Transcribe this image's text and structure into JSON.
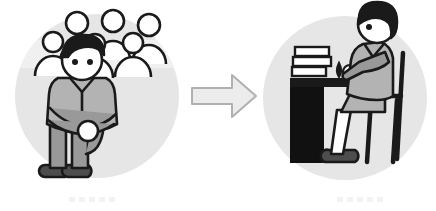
{
  "figure": {
    "type": "before-after-illustration",
    "direction": "left-to-right",
    "background_color": "#ffffff"
  },
  "colors": {
    "circle_background": "#e6e6e6",
    "crowd_band": "#f0f0f0",
    "outline": "#1a1a1a",
    "skin": "#ffffff",
    "hair": "#1a1a1a",
    "shirt": "#b3b3b3",
    "pants": "#999999",
    "shoes": "#4d4d4d",
    "desk_panel": "#111111",
    "desk_top": "#1a1a1a",
    "book_fill": "#ffffff",
    "arrow_fill": "#ececec",
    "arrow_stroke": "#b0b0b0",
    "caption_dot": "#f2f2f2"
  },
  "scene_before": {
    "label": "anxious-person-in-crowd",
    "circle": {
      "cx": 97,
      "cy": 96,
      "r": 82
    },
    "crowd": {
      "label": "crowd-of-people",
      "count": 6,
      "back_row": [
        {
          "cx": 77,
          "cy": 23,
          "r": 11
        },
        {
          "cx": 113,
          "cy": 21,
          "r": 11
        },
        {
          "cx": 149,
          "cy": 25,
          "r": 11
        }
      ],
      "front_row": [
        {
          "cx": 53,
          "cy": 42,
          "r": 10
        },
        {
          "cx": 95,
          "cy": 44,
          "r": 10
        },
        {
          "cx": 133,
          "cy": 43,
          "r": 10
        }
      ]
    },
    "seated_person": {
      "label": "seated-hugging-knees-person",
      "pose": "knees-hugged",
      "hair": "dark-short",
      "eyes": 2
    }
  },
  "arrow": {
    "label": "transition-arrow",
    "points": "right",
    "text": ""
  },
  "scene_after": {
    "label": "person-working-at-desk",
    "circle": {
      "cx": 345,
      "cy": 98,
      "r": 82
    },
    "desk": {
      "label": "desk",
      "has_dark_side_panel": true
    },
    "books": {
      "label": "stack-of-books",
      "count": 3
    },
    "desk_items": [
      {
        "label": "mug"
      },
      {
        "label": "small-object"
      }
    ],
    "chair": {
      "label": "chair",
      "back": "tall"
    },
    "person": {
      "label": "working-person",
      "pose": "seated-at-desk-profile",
      "hair": "dark-short",
      "eyes": 1
    }
  },
  "captions": {
    "before_dots": [
      "",
      "",
      "",
      "",
      ""
    ],
    "after_dots": [
      "",
      "",
      "",
      "",
      ""
    ]
  }
}
